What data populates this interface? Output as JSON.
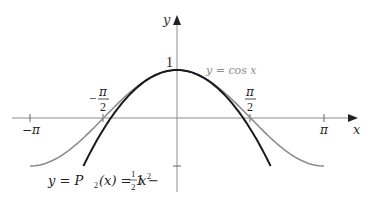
{
  "chart_data": {
    "type": "line",
    "title": "",
    "xlabel": "x",
    "ylabel": "y",
    "xlim": [
      -3.6,
      3.6
    ],
    "ylim": [
      -1.3,
      1.8
    ],
    "grid": false,
    "x_ticks": [
      {
        "value": -3.14159,
        "label": "−π"
      },
      {
        "value": -1.5708,
        "label": "−π/2"
      },
      {
        "value": 1.5708,
        "label": "π/2"
      },
      {
        "value": 3.14159,
        "label": "π"
      }
    ],
    "y_ticks": [
      {
        "value": 1,
        "label": "1"
      },
      {
        "value": -1,
        "label": ""
      }
    ],
    "series": [
      {
        "name": "y = cos x",
        "color": "#8c8c8c",
        "function": "cos(x)",
        "domain": [
          -3.14159,
          3.14159
        ]
      },
      {
        "name": "y = P2(x) = 1 − (1/2)x²",
        "color": "#1a1a1a",
        "function": "1 - x^2/2",
        "domain": [
          -2.0,
          2.0
        ]
      }
    ],
    "annotations": [
      {
        "text": "y = cos x",
        "near": [
          1.0,
          1.0
        ]
      },
      {
        "text": "y = P2(x) = 1 − ½x²",
        "near": [
          -1.8,
          -1.3
        ]
      }
    ]
  },
  "labels": {
    "x_axis": "x",
    "y_axis": "y",
    "one": "1",
    "neg_pi": "−π",
    "pi": "π",
    "pi_sym": "π",
    "two": "2",
    "minus": "−",
    "cos_label": "y = cos x",
    "p2_prefix": "y = P",
    "p2_sub": "2",
    "p2_mid": "(x) = 1 −",
    "half_num": "1",
    "half_den": "2",
    "p2_x": "x",
    "p2_exp": "2"
  }
}
